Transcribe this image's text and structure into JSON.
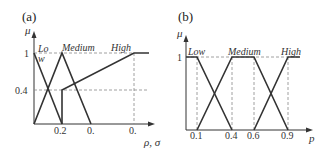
{
  "panels": [
    {
      "id": "a",
      "label": "(a)",
      "y_axis_label": "μ",
      "x_axis_label": "ρ, σ",
      "y_ticks": [
        "1",
        "0.4"
      ],
      "x_ticks": [
        "0.2",
        "0.",
        "0."
      ],
      "sets": [
        {
          "name": "Low",
          "display_lines": [
            "Lo",
            "w"
          ]
        },
        {
          "name": "Medium",
          "display": "Medium"
        },
        {
          "name": "High",
          "display": "High"
        }
      ]
    },
    {
      "id": "b",
      "label": "(b)",
      "y_axis_label": "μ",
      "x_axis_label": "p",
      "y_ticks": [
        "1"
      ],
      "x_ticks": [
        "0.1",
        "0.4",
        "0.6",
        "0.9"
      ],
      "sets": [
        {
          "name": "Low",
          "display": "Low"
        },
        {
          "name": "Medium",
          "display": "Medium"
        },
        {
          "name": "High",
          "display": "High"
        }
      ]
    }
  ],
  "colors": {
    "line": "#333333",
    "dashed": "#888888",
    "background": "#ffffff"
  }
}
